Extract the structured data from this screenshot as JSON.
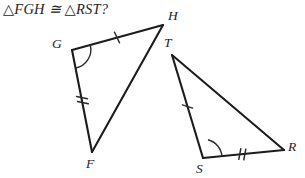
{
  "problem": {
    "statement": "△FGH ≅ △RST?"
  },
  "figure": {
    "type": "congruent-triangles-diagram",
    "background_color": "#ffffff",
    "stroke_color": "#1c1c1c",
    "triangles": [
      {
        "name": "FGH",
        "vertices": [
          {
            "label": "G",
            "x": 72,
            "y": 50,
            "label_x": 52,
            "label_y": 36
          },
          {
            "label": "H",
            "x": 163,
            "y": 25,
            "label_x": 168,
            "label_y": 8
          },
          {
            "label": "F",
            "x": 92,
            "y": 152,
            "label_x": 86,
            "label_y": 156
          }
        ],
        "sides": [
          {
            "from": "G",
            "to": "H",
            "ticks": 1
          },
          {
            "from": "G",
            "to": "F",
            "ticks": 2
          },
          {
            "from": "F",
            "to": "H",
            "ticks": 0
          }
        ],
        "marked_angle": {
          "at": "G",
          "arcs": 1
        }
      },
      {
        "name": "RST",
        "vertices": [
          {
            "label": "T",
            "x": 172,
            "y": 55,
            "label_x": 164,
            "label_y": 35
          },
          {
            "label": "S",
            "x": 203,
            "y": 158,
            "label_x": 196,
            "label_y": 161
          },
          {
            "label": "R",
            "x": 284,
            "y": 150,
            "label_x": 288,
            "label_y": 139
          }
        ],
        "sides": [
          {
            "from": "T",
            "to": "S",
            "ticks": 1
          },
          {
            "from": "S",
            "to": "R",
            "ticks": 2
          },
          {
            "from": "T",
            "to": "R",
            "ticks": 0
          }
        ],
        "marked_angle": {
          "at": "S",
          "arcs": 1
        }
      }
    ]
  }
}
